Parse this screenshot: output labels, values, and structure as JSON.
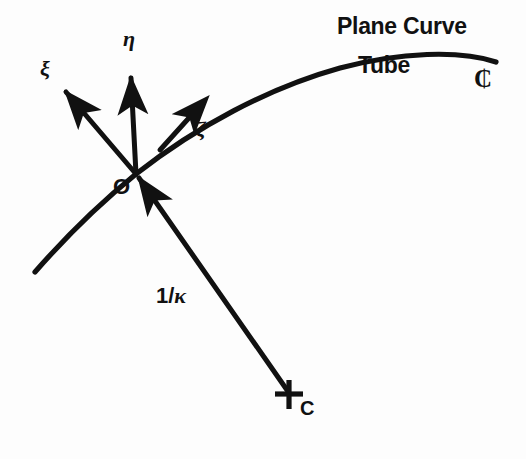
{
  "figure": {
    "background_color": "#fdfdfd",
    "ink_color": "#111111"
  },
  "labels": {
    "plane_curve": "Plane Curve",
    "tube": "Tube",
    "centerline_symbol": "₵",
    "axis_xi": "ξ",
    "axis_eta": "η",
    "axis_zeta": "ζ",
    "origin": "O",
    "radius_of_curvature_prefix": "1/",
    "radius_of_curvature_kappa": "κ",
    "center_of_curvature": "C"
  },
  "geometry": {
    "origin_point": [
      136,
      174
    ],
    "center_of_curvature_point": [
      290,
      394
    ],
    "curve_left_end": [
      35,
      272
    ],
    "curve_right_end": [
      496,
      62
    ],
    "curve_path": "M 35 272 C 70 232 104 200 136 174 C 196 127 268 88 340 68 C 400 52 460 50 496 62",
    "axis_xi_tip": [
      62,
      88
    ],
    "axis_eta_tip": [
      131,
      72
    ],
    "axis_zeta_tip_on_curve": [
      196,
      110
    ],
    "radius_line": [
      [
        290,
        394
      ],
      [
        136,
        174
      ]
    ]
  }
}
